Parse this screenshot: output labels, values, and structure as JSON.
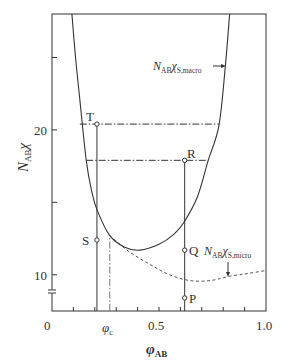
{
  "chart_data": {
    "type": "line",
    "title": "",
    "xlabel": "φAB",
    "ylabel": "NABχ",
    "xlim": [
      0,
      1.0
    ],
    "ylim": [
      7.5,
      28.0
    ],
    "grid": false,
    "x_ticks": [
      {
        "value": 0,
        "label": "0"
      },
      {
        "value": 0.5,
        "label": "0.5"
      },
      {
        "value": 1.0,
        "label": "1.0"
      }
    ],
    "x_minor_ticks": [
      0.1,
      0.2,
      0.3,
      0.4,
      0.6,
      0.7,
      0.8,
      0.9
    ],
    "y_ticks": [
      {
        "value": 10,
        "label": "10"
      },
      {
        "value": 15,
        "label": ""
      },
      {
        "value": 20,
        "label": "20"
      },
      {
        "value": 25,
        "label": ""
      }
    ],
    "y_axis_break": 8.8,
    "series": [
      {
        "name": "NABχS,macro",
        "style": "solid",
        "points": [
          [
            0.093,
            28.0
          ],
          [
            0.11,
            25.0
          ],
          [
            0.13,
            22.1
          ],
          [
            0.16,
            17.9
          ],
          [
            0.185,
            15.8
          ],
          [
            0.21,
            14.5
          ],
          [
            0.27,
            12.7
          ],
          [
            0.34,
            11.9
          ],
          [
            0.41,
            11.7
          ],
          [
            0.5,
            12.1
          ],
          [
            0.57,
            12.8
          ],
          [
            0.62,
            13.7
          ],
          [
            0.68,
            15.4
          ],
          [
            0.73,
            17.9
          ],
          [
            0.78,
            20.3
          ],
          [
            0.81,
            24.4
          ],
          [
            0.83,
            28.0
          ]
        ]
      },
      {
        "name": "NABχS,micro",
        "style": "dashed",
        "points": [
          [
            0.27,
            12.7
          ],
          [
            0.36,
            11.6
          ],
          [
            0.46,
            10.7
          ],
          [
            0.55,
            10.0
          ],
          [
            0.645,
            9.6
          ],
          [
            0.74,
            9.6
          ],
          [
            0.83,
            9.9
          ],
          [
            0.92,
            10.1
          ],
          [
            1.0,
            10.3
          ]
        ]
      }
    ],
    "reference_lines": [
      {
        "type": "horizontal",
        "style": "dash-dot",
        "y": 20.4,
        "x_range": [
          0.13,
          0.78
        ]
      },
      {
        "type": "horizontal",
        "style": "dash-dot",
        "y": 17.9,
        "x_range": [
          0.16,
          0.73
        ]
      },
      {
        "type": "vertical",
        "style": "solid",
        "x": 0.21,
        "y_range": [
          7.5,
          20.4
        ]
      },
      {
        "type": "vertical",
        "style": "solid",
        "x": 0.62,
        "y_range": [
          7.5,
          17.9
        ]
      },
      {
        "type": "vertical",
        "style": "dash-dot",
        "x": 0.27,
        "y_range": [
          7.5,
          12.7
        ],
        "label": "φc"
      }
    ],
    "points_labeled": [
      {
        "label": "T",
        "x": 0.21,
        "y": 20.4
      },
      {
        "label": "R",
        "x": 0.62,
        "y": 17.9
      },
      {
        "label": "S",
        "x": 0.21,
        "y": 12.4
      },
      {
        "label": "Q",
        "x": 0.62,
        "y": 11.7
      },
      {
        "label": "P",
        "x": 0.62,
        "y": 8.4
      }
    ],
    "annotations": [
      {
        "text": "NABχS,macro",
        "arrow_to": [
          0.81,
          24.4
        ]
      },
      {
        "text": "NABχS,micro",
        "arrow_to": [
          0.82,
          9.9
        ]
      }
    ]
  },
  "labels": {
    "x_axis": {
      "main": "φ",
      "sub": "AB"
    },
    "y_axis": {
      "main": "N",
      "sub": "AB",
      "tail": "χ"
    },
    "phi_c": {
      "main": "φ",
      "sub": "c"
    },
    "tick_0": "0",
    "tick_05": "0.5",
    "tick_10": "1.0",
    "ytick_10": "10",
    "ytick_20": "20",
    "macro": {
      "n": "N",
      "sub1": "AB",
      "chi": "χ",
      "sub2": "S,macro"
    },
    "micro": {
      "n": "N",
      "sub1": "AB",
      "chi": "χ",
      "sub2": "S,micro"
    },
    "T": "T",
    "R": "R",
    "S": "S",
    "Q": "Q",
    "P": "P"
  }
}
